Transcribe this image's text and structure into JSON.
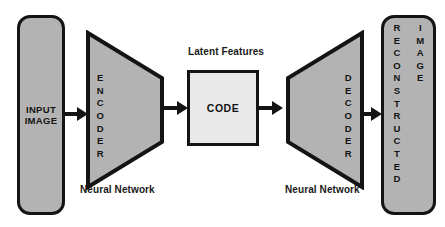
{
  "diagram": {
    "colors": {
      "block_fill": "#b3b3b3",
      "code_fill": "#e9e9e9",
      "stroke": "#141414",
      "text": "#141414",
      "background": "#ffffff"
    },
    "input_block": {
      "name": "input-image",
      "line1": "INPUT",
      "line2": "IMAGE",
      "orientation": "vertical"
    },
    "encoder_block": {
      "name": "encoder",
      "label": "ENCODER",
      "orientation": "vertical",
      "shape": "trapezoid-narrowing-right",
      "caption": "Neural Network"
    },
    "code_block": {
      "name": "code",
      "label": "CODE",
      "caption": "Latent Features",
      "shape": "rectangle"
    },
    "decoder_block": {
      "name": "decoder",
      "label": "DECODER",
      "orientation": "vertical",
      "shape": "trapezoid-widening-right",
      "caption": "Neural Network"
    },
    "output_block": {
      "name": "reconstructed-image",
      "line1": "RECONSTRUCTED",
      "line2": "IMAGE",
      "orientation": "vertical"
    },
    "arrows": [
      {
        "name": "arrow-input-to-encoder",
        "from": "input-image",
        "to": "encoder",
        "direction": "right"
      },
      {
        "name": "arrow-encoder-to-code",
        "from": "encoder",
        "to": "code",
        "direction": "right"
      },
      {
        "name": "arrow-code-to-decoder",
        "from": "code",
        "to": "decoder",
        "direction": "right"
      },
      {
        "name": "arrow-decoder-to-output",
        "from": "decoder",
        "to": "reconstructed-image",
        "direction": "right"
      }
    ]
  }
}
